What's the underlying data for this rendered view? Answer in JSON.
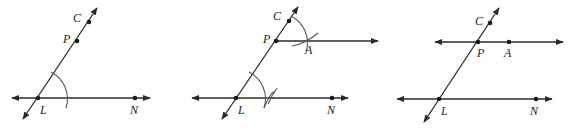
{
  "diagram": {
    "panels": [
      {
        "id": "step-1",
        "labels": {
          "C": "C",
          "P": "P",
          "L": "L",
          "N": "N"
        }
      },
      {
        "id": "step-2",
        "labels": {
          "C": "C",
          "P": "P",
          "A": "A",
          "L": "L",
          "N": "N"
        }
      },
      {
        "id": "step-3",
        "labels": {
          "C": "C",
          "P": "P",
          "A": "A",
          "L": "L",
          "N": "N"
        }
      }
    ]
  },
  "colors": {
    "line": "#2a2a2a",
    "arc": "#555555",
    "background": "#ffffff"
  }
}
